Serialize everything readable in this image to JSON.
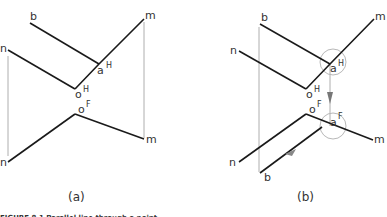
{
  "colors": {
    "line": "#1a1a1a",
    "projector": "#9a9a9a",
    "circle": "#b8b8b8",
    "text": "#333333"
  },
  "panel_a": {
    "caption": "(a)",
    "labels": {
      "b": "b",
      "n_top": "n",
      "m_top": "m",
      "a_top": "a",
      "a_top_sup": "H",
      "o_top": "o",
      "o_top_sup": "H",
      "o_bottom": "o",
      "o_bottom_sup": "F",
      "n_bottom": "n",
      "m_bottom": "m"
    }
  },
  "panel_b": {
    "caption": "(b)",
    "labels": {
      "b_top": "b",
      "n_top": "n",
      "m_top": "m",
      "a_top": "a",
      "a_top_sup": "H",
      "o_top": "o",
      "o_top_sup": "H",
      "o_bottom": "o",
      "o_bottom_sup": "F",
      "a_bottom": "a",
      "a_bottom_sup": "F",
      "n_bottom": "n",
      "m_bottom": "m",
      "b_bottom": "b"
    }
  },
  "figure_caption": "FIGURE 8.1   Parallel line through a point"
}
